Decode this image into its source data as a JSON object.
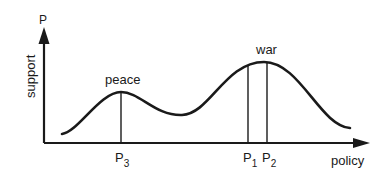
{
  "diagram": {
    "y_axis": {
      "top_label": "P",
      "title": "support"
    },
    "x_axis": {
      "title": "policy"
    },
    "peaks": [
      {
        "label": "peace",
        "marker": "P",
        "marker_sub": "3"
      },
      {
        "label": "war",
        "markers": [
          {
            "marker": "P",
            "marker_sub": "1"
          },
          {
            "marker": "P",
            "marker_sub": "2"
          }
        ]
      }
    ],
    "colors": {
      "ink": "#1a1a1a",
      "background": "#ffffff"
    }
  }
}
